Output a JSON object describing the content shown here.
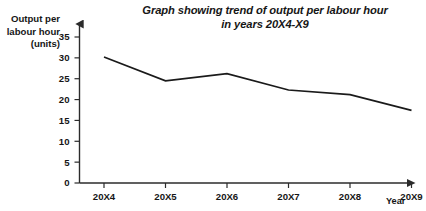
{
  "chart_data": {
    "type": "line",
    "title": "Graph showing trend of output per labour hour in years 20X4-X9",
    "title_lines": [
      "Graph showing trend of output per labour hour",
      "in years 20X4-X9"
    ],
    "ylabel": "Output per labour hour (units)",
    "ylabel_lines": [
      "Output per",
      "labour hour",
      "(units)"
    ],
    "xlabel": "Year",
    "categories": [
      "20X4",
      "20X5",
      "20X6",
      "20X7",
      "20X8",
      "20X9"
    ],
    "values": [
      30.2,
      24.5,
      26.2,
      22.3,
      21.2,
      17.4
    ],
    "yticks": [
      0,
      5,
      10,
      15,
      20,
      25,
      30,
      35
    ],
    "ytick_labels": [
      "0",
      "5",
      "10",
      "15",
      "20",
      "25",
      "30",
      "35"
    ],
    "ylim": [
      0,
      35
    ],
    "grid": false,
    "legend": false,
    "line_color": "#1a1a1a",
    "background_color": "#ffffff",
    "axis_color": "#2b2b2b"
  }
}
